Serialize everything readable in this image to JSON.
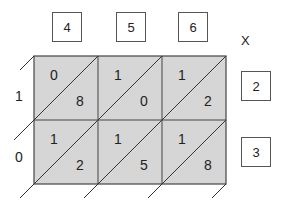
{
  "multiplicand_digits": [
    "4",
    "5",
    "6"
  ],
  "multiplier_digits": [
    "2",
    "3"
  ],
  "operator": "X",
  "cells": [
    [
      {
        "tens": "0",
        "ones": "8"
      },
      {
        "tens": "1",
        "ones": "0"
      },
      {
        "tens": "1",
        "ones": "2"
      }
    ],
    [
      {
        "tens": "1",
        "ones": "2"
      },
      {
        "tens": "1",
        "ones": "5"
      },
      {
        "tens": "1",
        "ones": "8"
      }
    ]
  ],
  "left_sums": [
    "1",
    "0"
  ],
  "colors": {
    "cell_fill": "#d6d6d6",
    "line": "#444444",
    "box_border": "#555555"
  }
}
